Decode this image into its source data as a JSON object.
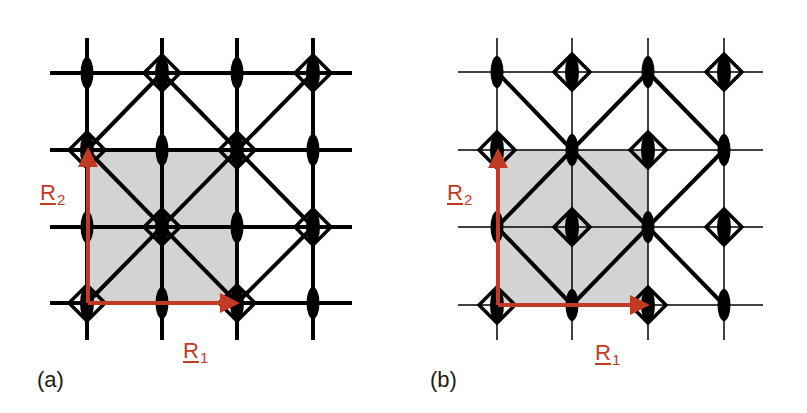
{
  "figure": {
    "colors": {
      "line": "#000000",
      "cell_fill": "#d3d3d3",
      "vector": "#c23a24",
      "background": "#ffffff"
    },
    "panels": [
      {
        "id": "a",
        "label": "(a)",
        "grid": {
          "xs": [
            87,
            162,
            237,
            313
          ],
          "ys": [
            73,
            150,
            227,
            303
          ],
          "x_extent": [
            50,
            352
          ],
          "y_extent": [
            38,
            340
          ],
          "stroke_width": 4
        },
        "unit_cell": {
          "x0": 87,
          "y0": 150,
          "x1": 237,
          "y1": 303
        },
        "diagonals": [
          [
            [
              87,
              150
            ],
            [
              162,
              73
            ]
          ],
          [
            [
              162,
              73
            ],
            [
              313,
              227
            ]
          ],
          [
            [
              87,
              150
            ],
            [
              237,
              303
            ]
          ],
          [
            [
              87,
              303
            ],
            [
              313,
              73
            ]
          ],
          [
            [
              237,
              303
            ],
            [
              313,
              227
            ]
          ]
        ],
        "diamonds": [
          [
            162,
            73
          ],
          [
            313,
            73
          ],
          [
            87,
            150
          ],
          [
            237,
            150
          ],
          [
            162,
            227
          ],
          [
            313,
            227
          ],
          [
            87,
            303
          ],
          [
            237,
            303
          ]
        ],
        "ellipses": [
          [
            87,
            73
          ],
          [
            237,
            73
          ],
          [
            162,
            150
          ],
          [
            313,
            150
          ],
          [
            87,
            227
          ],
          [
            237,
            227
          ],
          [
            162,
            303
          ],
          [
            313,
            303
          ]
        ],
        "vectors": {
          "r1": {
            "label": "R",
            "sub": "1",
            "from": [
              88,
              303
            ],
            "to": [
              236,
              303
            ]
          },
          "r2": {
            "label": "R",
            "sub": "2",
            "from": [
              88,
              303
            ],
            "to": [
              88,
              151
            ]
          }
        }
      },
      {
        "id": "b",
        "label": "(b)",
        "grid": {
          "xs": [
            497,
            572,
            648,
            724
          ],
          "ys": [
            72,
            150,
            227,
            305
          ],
          "x_extent": [
            458,
            763
          ],
          "y_extent": [
            38,
            340
          ],
          "stroke_width": 1.5
        },
        "unit_cell": {
          "x0": 497,
          "y0": 150,
          "x1": 648,
          "y1": 305
        },
        "diagonals": [
          [
            [
              497,
              72
            ],
            [
              572,
              150
            ]
          ],
          [
            [
              648,
              72
            ],
            [
              572,
              150
            ]
          ],
          [
            [
              648,
              72
            ],
            [
              724,
              150
            ]
          ],
          [
            [
              572,
              150
            ],
            [
              648,
              227
            ]
          ],
          [
            [
              572,
              150
            ],
            [
              497,
              227
            ]
          ],
          [
            [
              497,
              227
            ],
            [
              572,
              305
            ]
          ],
          [
            [
              572,
              305
            ],
            [
              648,
              227
            ]
          ],
          [
            [
              648,
              227
            ],
            [
              724,
              150
            ]
          ],
          [
            [
              648,
              227
            ],
            [
              724,
              305
            ]
          ]
        ],
        "diamonds": [
          [
            572,
            72
          ],
          [
            724,
            72
          ],
          [
            497,
            150
          ],
          [
            648,
            150
          ],
          [
            572,
            227
          ],
          [
            724,
            227
          ],
          [
            497,
            305
          ],
          [
            648,
            305
          ]
        ],
        "ellipses": [
          [
            497,
            72
          ],
          [
            648,
            72
          ],
          [
            572,
            150
          ],
          [
            724,
            150
          ],
          [
            497,
            227
          ],
          [
            648,
            227
          ],
          [
            572,
            305
          ],
          [
            724,
            305
          ]
        ],
        "vectors": {
          "r1": {
            "label": "R",
            "sub": "1",
            "from": [
              498,
              305
            ],
            "to": [
              646,
              305
            ]
          },
          "r2": {
            "label": "R",
            "sub": "2",
            "from": [
              498,
              305
            ],
            "to": [
              498,
              152
            ]
          }
        }
      }
    ]
  },
  "labels": {
    "panel_a": "(a)",
    "panel_b": "(b)",
    "a_r1_base": "R",
    "a_r1_sub": "1",
    "a_r2_base": "R",
    "a_r2_sub": "2",
    "b_r1_base": "R",
    "b_r1_sub": "1",
    "b_r2_base": "R",
    "b_r2_sub": "2"
  }
}
